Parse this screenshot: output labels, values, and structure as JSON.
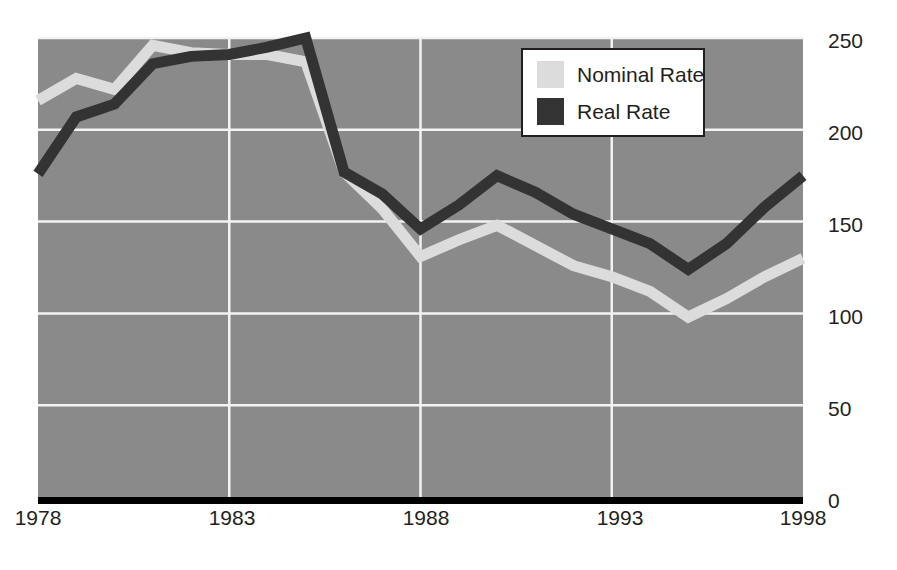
{
  "chart_data": {
    "type": "line",
    "title": "",
    "subtitle": "",
    "xlabel": "",
    "ylabel": "",
    "x": [
      1978,
      1979,
      1980,
      1981,
      1982,
      1983,
      1984,
      1985,
      1986,
      1987,
      1988,
      1989,
      1990,
      1991,
      1992,
      1993,
      1994,
      1995,
      1996,
      1997,
      1998
    ],
    "xticks": [
      "1978",
      "1983",
      "1988",
      "1993",
      "1998"
    ],
    "xtick_values": [
      1978,
      1983,
      1988,
      1993,
      1998
    ],
    "yticks": [
      "0",
      "50",
      "100",
      "150",
      "200",
      "250"
    ],
    "ytick_values": [
      0,
      50,
      100,
      150,
      200,
      250
    ],
    "ylim": [
      0,
      250
    ],
    "xlim": [
      1978,
      1998
    ],
    "grid": true,
    "legend_position": "top-right",
    "series": [
      {
        "name": "Nominal Rate",
        "color": "#dcdcdc",
        "values": [
          216,
          228,
          222,
          246,
          242,
          241,
          241,
          237,
          177,
          157,
          131,
          140,
          148,
          137,
          126,
          120,
          112,
          98,
          108,
          120,
          130
        ]
      },
      {
        "name": "Real Rate",
        "color": "#333333",
        "values": [
          176,
          207,
          214,
          236,
          240,
          241,
          245,
          250,
          177,
          165,
          146,
          159,
          175,
          166,
          154,
          146,
          138,
          124,
          138,
          158,
          175
        ]
      }
    ]
  },
  "legend": {
    "items": [
      {
        "label": "Nominal Rate",
        "color": "#dcdcdc"
      },
      {
        "label": "Real Rate",
        "color": "#333333"
      }
    ]
  },
  "axes": {
    "y_labels": [
      "250",
      "200",
      "150",
      "100",
      "50",
      "0"
    ],
    "x_labels": [
      "1978",
      "1983",
      "1988",
      "1993",
      "1998"
    ]
  },
  "colors": {
    "plot_background": "#8a8a8a",
    "grid": "#f2f2f2",
    "baseline": "#000000",
    "text": "#231f20",
    "nominal": "#dcdcdc",
    "real": "#333333"
  }
}
